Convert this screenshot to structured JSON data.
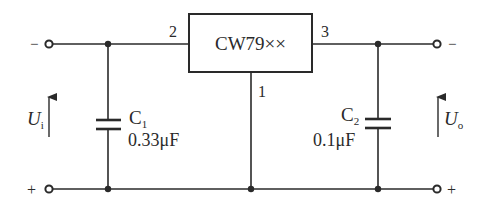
{
  "diagram": {
    "type": "circuit-schematic",
    "regulator": {
      "label": "CW79××",
      "pin_input": "2",
      "pin_output": "3",
      "pin_ground": "1"
    },
    "capacitors": [
      {
        "name": "C",
        "sub": "1",
        "value": "0.33μF"
      },
      {
        "name": "C",
        "sub": "2",
        "value": "0.1μF"
      }
    ],
    "input": {
      "voltage_symbol": "U",
      "voltage_sub": "i",
      "top_polarity": "−",
      "bottom_polarity": "+"
    },
    "output": {
      "voltage_symbol": "U",
      "voltage_sub": "o",
      "top_polarity": "−",
      "bottom_polarity": "+"
    }
  }
}
